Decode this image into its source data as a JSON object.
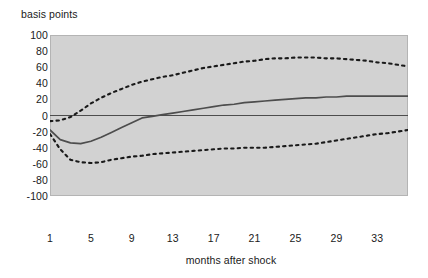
{
  "chart_data": {
    "type": "line",
    "title": "",
    "ylabel": "basis points",
    "xlabel": "months after shock",
    "ylim": [
      -100,
      100
    ],
    "xlim": [
      1,
      36
    ],
    "yticks": [
      100,
      80,
      60,
      40,
      20,
      0,
      -20,
      -40,
      -60,
      -80,
      -100
    ],
    "xticks": [
      1,
      5,
      9,
      13,
      17,
      21,
      25,
      29,
      33
    ],
    "grid": false,
    "legend": "none",
    "plot_background": "#d2d2d2",
    "line_color": "#4d4d4d",
    "band_color": "#1a1a1a",
    "zero_line": 0,
    "x": [
      1,
      2,
      3,
      4,
      5,
      6,
      7,
      8,
      9,
      10,
      11,
      12,
      13,
      14,
      15,
      16,
      17,
      18,
      19,
      20,
      21,
      22,
      23,
      24,
      25,
      26,
      27,
      28,
      29,
      30,
      31,
      32,
      33,
      34,
      35,
      36
    ],
    "series": [
      {
        "name": "impulse response",
        "style": "solid",
        "values": [
          -18,
          -30,
          -34,
          -35,
          -32,
          -27,
          -21,
          -15,
          -9,
          -3,
          -1,
          1,
          3,
          5,
          7,
          9,
          11,
          13,
          14,
          16,
          17,
          18,
          19,
          20,
          21,
          22,
          22,
          23,
          23,
          24,
          24,
          24,
          24,
          24,
          24,
          24
        ]
      },
      {
        "name": "upper confidence band",
        "style": "dotted",
        "values": [
          -7,
          -6,
          -2,
          6,
          15,
          22,
          28,
          33,
          38,
          42,
          45,
          48,
          50,
          53,
          56,
          59,
          61,
          63,
          65,
          67,
          68,
          70,
          71,
          71,
          72,
          72,
          72,
          71,
          71,
          70,
          69,
          68,
          66,
          65,
          63,
          61
        ]
      },
      {
        "name": "lower confidence band",
        "style": "dotted",
        "values": [
          -23,
          -42,
          -55,
          -58,
          -59,
          -58,
          -55,
          -53,
          -51,
          -50,
          -48,
          -47,
          -46,
          -45,
          -44,
          -43,
          -42,
          -41,
          -41,
          -40,
          -40,
          -40,
          -39,
          -38,
          -37,
          -36,
          -35,
          -33,
          -31,
          -29,
          -27,
          -25,
          -23,
          -22,
          -20,
          -18
        ]
      }
    ]
  }
}
